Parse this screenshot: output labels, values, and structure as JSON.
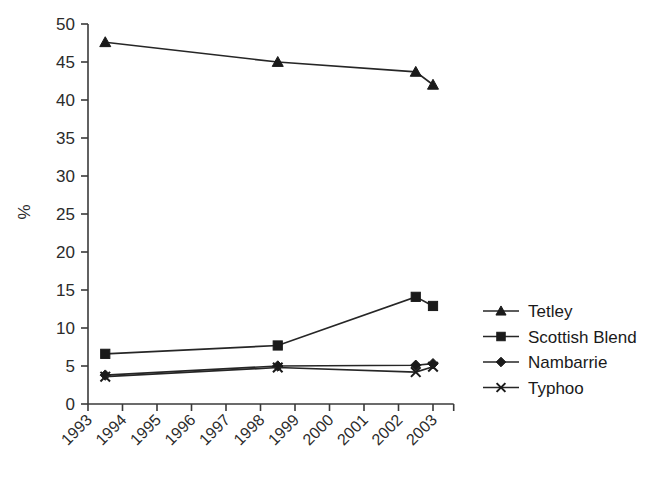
{
  "chart_data": {
    "type": "line",
    "title": "",
    "subtitle": "",
    "xlabel": "",
    "ylabel": "%",
    "xlim": [
      1993,
      2003.6
    ],
    "ylim": [
      0,
      50
    ],
    "grid": false,
    "legend_position": "right",
    "x_tick_labels": [
      "1993",
      "1994",
      "1995",
      "1996",
      "1997",
      "1998",
      "1999",
      "2000",
      "2001",
      "2002",
      "2003"
    ],
    "x_tick_values": [
      1993,
      1994,
      1995,
      1996,
      1997,
      1998,
      1999,
      2000,
      2001,
      2002,
      2003
    ],
    "y_tick_labels": [
      "0",
      "5",
      "10",
      "15",
      "20",
      "25",
      "30",
      "35",
      "40",
      "45",
      "50"
    ],
    "y_tick_values": [
      0,
      5,
      10,
      15,
      20,
      25,
      30,
      35,
      40,
      45,
      50
    ],
    "x": [
      1993.5,
      1998.5,
      2002.5,
      2003.0
    ],
    "series": [
      {
        "name": "Tetley",
        "marker": "triangle",
        "values": [
          47.6,
          45.0,
          43.7,
          42.0
        ]
      },
      {
        "name": "Scottish Blend",
        "marker": "square",
        "values": [
          6.6,
          7.7,
          14.1,
          12.9
        ]
      },
      {
        "name": "Nambarrie",
        "marker": "diamond",
        "values": [
          3.8,
          5.0,
          5.1,
          5.3
        ]
      },
      {
        "name": "Typhoo",
        "marker": "cross",
        "values": [
          3.6,
          4.8,
          4.2,
          4.9
        ]
      }
    ],
    "colors": {
      "line": "#262626",
      "marker": "#1a1a1a",
      "axis": "#3a3a3a",
      "text": "#2b2b2b",
      "background": "#ffffff"
    }
  },
  "legend": {
    "items": [
      {
        "label": "Tetley",
        "marker": "triangle"
      },
      {
        "label": "Scottish Blend",
        "marker": "square"
      },
      {
        "label": "Nambarrie",
        "marker": "diamond"
      },
      {
        "label": "Typhoo",
        "marker": "cross"
      }
    ]
  }
}
